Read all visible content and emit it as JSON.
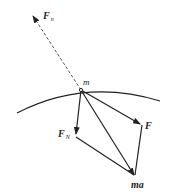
{
  "diagram": {
    "type": "force-vector-parallelogram",
    "labels": {
      "fn_top": {
        "main": "F",
        "sub": "n"
      },
      "mass_point": "m",
      "f_normal": {
        "main": "F",
        "sub": "N"
      },
      "f_force": {
        "main": "F"
      },
      "resultant": "ma"
    },
    "points": {
      "m": [
        81,
        90
      ],
      "fn_top_tip": [
        32,
        15
      ],
      "fN_tip": [
        76,
        135
      ],
      "F_tip": [
        141,
        124
      ],
      "ma_tip": [
        135,
        176
      ]
    },
    "colors": {
      "line": "#222222",
      "background": "#ffffff"
    }
  }
}
